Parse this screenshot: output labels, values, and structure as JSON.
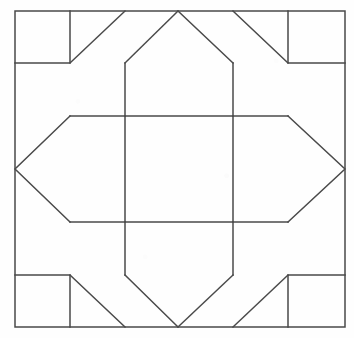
{
  "figure": {
    "background_color": "#fefefe",
    "stroke_color": "#4a4a4a",
    "stroke_width": 1.5,
    "canvas": {
      "width": 354,
      "height": 338
    },
    "geometry": {
      "outer_square": {
        "left": 15,
        "top": 11,
        "right": 345,
        "bottom": 327
      },
      "inner_rectangle": {
        "left": 125,
        "top": 116,
        "right": 233,
        "bottom": 222
      },
      "corner_squares": [
        {
          "name": "top-left",
          "left": 15,
          "top": 11,
          "right": 70,
          "bottom": 63
        },
        {
          "name": "top-right",
          "left": 288,
          "top": 11,
          "right": 345,
          "bottom": 63
        },
        {
          "name": "bottom-left",
          "left": 15,
          "top": 275,
          "right": 70,
          "bottom": 327
        },
        {
          "name": "bottom-right",
          "left": 288,
          "top": 275,
          "right": 345,
          "bottom": 327
        }
      ],
      "edge_vertices": {
        "top_peak": {
          "x": 178,
          "y": 11
        },
        "bottom_valley": {
          "x": 178,
          "y": 327
        },
        "left_vertex": {
          "x": 15,
          "y": 169
        },
        "right_vertex": {
          "x": 345,
          "y": 169
        }
      },
      "diagonals": [
        {
          "name": "top-left-outer",
          "from": [
            70,
            63
          ],
          "to": [
            125,
            11
          ]
        },
        {
          "name": "top-left-inner",
          "from": [
            125,
            63
          ],
          "to": [
            178,
            11
          ]
        },
        {
          "name": "top-right-inner",
          "from": [
            178,
            11
          ],
          "to": [
            233,
            63
          ]
        },
        {
          "name": "top-right-outer",
          "from": [
            233,
            11
          ],
          "to": [
            288,
            63
          ]
        },
        {
          "name": "left-upper",
          "from": [
            70,
            116
          ],
          "to": [
            15,
            169
          ]
        },
        {
          "name": "left-lower",
          "from": [
            15,
            169
          ],
          "to": [
            70,
            222
          ]
        },
        {
          "name": "right-upper",
          "from": [
            288,
            116
          ],
          "to": [
            345,
            169
          ]
        },
        {
          "name": "right-lower",
          "from": [
            345,
            169
          ],
          "to": [
            288,
            222
          ]
        },
        {
          "name": "bottom-left-outer",
          "from": [
            70,
            275
          ],
          "to": [
            125,
            327
          ]
        },
        {
          "name": "bottom-left-inner",
          "from": [
            125,
            275
          ],
          "to": [
            178,
            327
          ]
        },
        {
          "name": "bottom-right-inner",
          "from": [
            178,
            327
          ],
          "to": [
            233,
            275
          ]
        },
        {
          "name": "bottom-right-outer",
          "from": [
            233,
            327
          ],
          "to": [
            288,
            275
          ]
        }
      ],
      "struts": [
        {
          "name": "top-left-vertical",
          "from": [
            125,
            63
          ],
          "to": [
            125,
            116
          ]
        },
        {
          "name": "top-right-vertical",
          "from": [
            233,
            63
          ],
          "to": [
            233,
            116
          ]
        },
        {
          "name": "bottom-left-vertical",
          "from": [
            125,
            222
          ],
          "to": [
            125,
            275
          ]
        },
        {
          "name": "bottom-right-vertical",
          "from": [
            233,
            222
          ],
          "to": [
            233,
            275
          ]
        },
        {
          "name": "upper-horizontal-left",
          "from": [
            70,
            116
          ],
          "to": [
            125,
            116
          ]
        },
        {
          "name": "upper-horizontal-right",
          "from": [
            233,
            116
          ],
          "to": [
            288,
            116
          ]
        },
        {
          "name": "lower-horizontal-left",
          "from": [
            70,
            222
          ],
          "to": [
            125,
            222
          ]
        },
        {
          "name": "lower-horizontal-right",
          "from": [
            233,
            222
          ],
          "to": [
            288,
            222
          ]
        }
      ]
    }
  }
}
